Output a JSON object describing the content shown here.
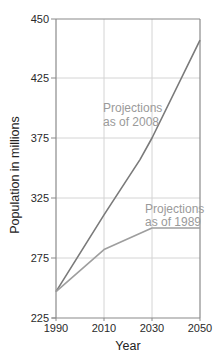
{
  "chart_data": {
    "type": "line",
    "title": "",
    "xlabel": "Year",
    "ylabel": "Population in millions",
    "x_ticks": [
      "1990",
      "2010",
      "2030",
      "2050"
    ],
    "y_ticks": [
      "450",
      "425",
      "375",
      "325",
      "275",
      "225"
    ],
    "ylim": [
      225,
      450
    ],
    "xlim": [
      1990,
      2050
    ],
    "grid": true,
    "legend": "inline labels",
    "series": [
      {
        "name": "Projections as of 2008",
        "label_lines": [
          "Projections",
          "as of 2008"
        ],
        "x": [
          1990,
          2010,
          2025,
          2030,
          2050
        ],
        "values": [
          247,
          311,
          357,
          375,
          441
        ],
        "color": "#7a7a7a"
      },
      {
        "name": "Projections as of 1989",
        "label_lines": [
          "Projections",
          "as of 1989"
        ],
        "x": [
          1990,
          2010,
          2030,
          2050
        ],
        "values": [
          247,
          282,
          300,
          300
        ],
        "color": "#9e9e9e"
      }
    ]
  },
  "layout": {
    "tick_y_px": [
      19,
      78,
      138,
      198,
      258,
      318
    ],
    "tick_x_px": [
      56,
      104,
      152,
      200
    ]
  },
  "colors": {
    "axis": "#8a8a8a",
    "grid": "#d4d4d4",
    "label": "#9a9a9a"
  }
}
